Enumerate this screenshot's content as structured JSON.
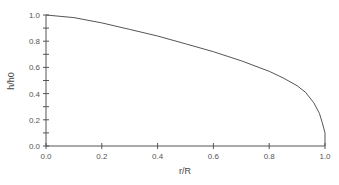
{
  "chart_data": {
    "type": "line",
    "title": "",
    "xlabel": "r/R",
    "ylabel": "h/h0",
    "xlim": [
      0.0,
      1.0
    ],
    "ylim": [
      0.0,
      1.0
    ],
    "grid": false,
    "legend": null,
    "x_ticks": [
      "0.0",
      "0.2",
      "0.4",
      "0.6",
      "0.8",
      "1.0"
    ],
    "y_ticks": [
      "0.0",
      "0.2",
      "0.4",
      "0.6",
      "0.8",
      "1.0"
    ],
    "series": [
      {
        "name": "h/h0",
        "x": [
          0.0,
          0.1,
          0.2,
          0.3,
          0.4,
          0.5,
          0.6,
          0.7,
          0.8,
          0.85,
          0.9,
          0.93,
          0.96,
          0.98,
          0.99,
          1.0,
          1.0
        ],
        "y": [
          1.0,
          0.98,
          0.94,
          0.89,
          0.84,
          0.78,
          0.72,
          0.65,
          0.57,
          0.52,
          0.46,
          0.41,
          0.33,
          0.25,
          0.18,
          0.1,
          0.0
        ]
      }
    ],
    "color": "#555555"
  }
}
